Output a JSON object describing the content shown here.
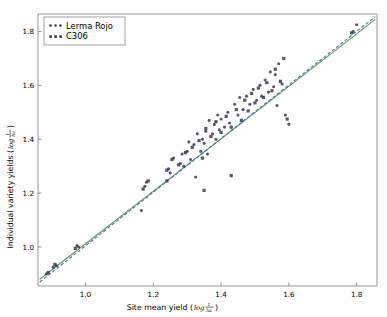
{
  "chart_data": {
    "type": "scatter",
    "title": "",
    "xlabel": "Site mean yield (log t/ha)",
    "ylabel": "Individual variety yields (log t/ha)",
    "xlabel_text": "Site mean yield (",
    "ylabel_text": "Individual variety yields (",
    "log_symbol": "log",
    "frac_numerator": "t",
    "frac_denominator": "ha",
    "paren_close": ")",
    "xlim": [
      0.86,
      1.86
    ],
    "ylim": [
      0.855,
      1.865
    ],
    "xticks": [
      1.0,
      1.2,
      1.4,
      1.6,
      1.8
    ],
    "yticks": [
      1.0,
      1.2,
      1.4,
      1.6,
      1.8
    ],
    "xticklabels": [
      "1.0",
      "1.2",
      "1.4",
      "1.6",
      "1.8"
    ],
    "yticklabels": [
      "1.0",
      "1.2",
      "1.4",
      "1.6",
      "1.8"
    ],
    "grid": false,
    "legend_position": "upper left",
    "marker_color": "#3a3a4e",
    "series": [
      {
        "name": "Lerma Rojo",
        "marker": "dot",
        "color": "#3a3a4e",
        "points": [
          [
            0.885,
            0.9
          ],
          [
            0.905,
            0.925
          ],
          [
            0.915,
            0.93
          ],
          [
            0.975,
            1.005
          ],
          [
            0.98,
            1.0
          ],
          [
            1.165,
            1.135
          ],
          [
            1.175,
            1.225
          ],
          [
            1.18,
            1.24
          ],
          [
            1.245,
            1.29
          ],
          [
            1.25,
            1.275
          ],
          [
            1.26,
            1.33
          ],
          [
            1.28,
            1.31
          ],
          [
            1.285,
            1.345
          ],
          [
            1.29,
            1.3
          ],
          [
            1.3,
            1.355
          ],
          [
            1.305,
            1.39
          ],
          [
            1.31,
            1.325
          ],
          [
            1.32,
            1.38
          ],
          [
            1.325,
            1.26
          ],
          [
            1.33,
            1.42
          ],
          [
            1.34,
            1.355
          ],
          [
            1.345,
            1.4
          ],
          [
            1.35,
            1.385
          ],
          [
            1.355,
            1.43
          ],
          [
            1.36,
            1.345
          ],
          [
            1.365,
            1.47
          ],
          [
            1.375,
            1.42
          ],
          [
            1.38,
            1.455
          ],
          [
            1.385,
            1.4
          ],
          [
            1.39,
            1.49
          ],
          [
            1.395,
            1.435
          ],
          [
            1.4,
            1.475
          ],
          [
            1.41,
            1.445
          ],
          [
            1.42,
            1.5
          ],
          [
            1.425,
            1.46
          ],
          [
            1.44,
            1.53
          ],
          [
            1.45,
            1.49
          ],
          [
            1.455,
            1.555
          ],
          [
            1.465,
            1.51
          ],
          [
            1.475,
            1.56
          ],
          [
            1.485,
            1.53
          ],
          [
            1.495,
            1.585
          ],
          [
            1.505,
            1.545
          ],
          [
            1.515,
            1.6
          ],
          [
            1.52,
            1.56
          ],
          [
            1.53,
            1.62
          ],
          [
            1.54,
            1.575
          ],
          [
            1.545,
            1.65
          ],
          [
            1.555,
            1.595
          ],
          [
            1.56,
            1.64
          ],
          [
            1.565,
            1.525
          ],
          [
            1.57,
            1.68
          ],
          [
            1.58,
            1.605
          ],
          [
            1.59,
            1.49
          ],
          [
            1.6,
            1.455
          ],
          [
            1.79,
            1.8
          ],
          [
            1.8,
            1.825
          ]
        ]
      },
      {
        "name": "C306",
        "marker": "square",
        "color": "#3a3a4e",
        "points": [
          [
            0.89,
            0.905
          ],
          [
            0.91,
            0.935
          ],
          [
            0.97,
            0.995
          ],
          [
            1.17,
            1.215
          ],
          [
            1.185,
            1.245
          ],
          [
            1.24,
            1.285
          ],
          [
            1.255,
            1.325
          ],
          [
            1.275,
            1.305
          ],
          [
            1.295,
            1.35
          ],
          [
            1.315,
            1.37
          ],
          [
            1.335,
            1.395
          ],
          [
            1.345,
            1.33
          ],
          [
            1.355,
            1.44
          ],
          [
            1.37,
            1.41
          ],
          [
            1.385,
            1.465
          ],
          [
            1.4,
            1.425
          ],
          [
            1.415,
            1.485
          ],
          [
            1.43,
            1.445
          ],
          [
            1.445,
            1.51
          ],
          [
            1.46,
            1.47
          ],
          [
            1.47,
            1.545
          ],
          [
            1.48,
            1.505
          ],
          [
            1.49,
            1.57
          ],
          [
            1.5,
            1.535
          ],
          [
            1.51,
            1.59
          ],
          [
            1.525,
            1.555
          ],
          [
            1.535,
            1.61
          ],
          [
            1.55,
            1.58
          ],
          [
            1.56,
            1.66
          ],
          [
            1.575,
            1.615
          ],
          [
            1.585,
            1.7
          ],
          [
            1.43,
            1.265
          ],
          [
            1.35,
            1.21
          ],
          [
            1.24,
            1.245
          ],
          [
            1.595,
            1.475
          ],
          [
            1.785,
            1.795
          ]
        ]
      }
    ],
    "lines": [
      {
        "name": "regression-line-solid",
        "style": "solid",
        "color": "#5a9b5a",
        "x": [
          0.865,
          1.855
        ],
        "y": [
          0.88,
          1.845
        ]
      },
      {
        "name": "regression-line-dashed",
        "style": "dashed",
        "color": "#4a6fa5",
        "x": [
          0.865,
          1.855
        ],
        "y": [
          0.87,
          1.855
        ]
      }
    ]
  },
  "legend": {
    "entries": [
      {
        "label": "Lerma Rojo",
        "marker": "dot"
      },
      {
        "label": "C306",
        "marker": "square"
      }
    ]
  },
  "axes": {
    "spine_color": "#8a8a8a",
    "background": "#ffffff"
  }
}
